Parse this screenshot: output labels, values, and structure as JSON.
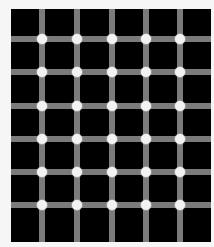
{
  "figure": {
    "canvas": {
      "width": 214,
      "height": 247,
      "background": "#f6f6f6"
    },
    "board": {
      "left": 11,
      "top": 9,
      "right": 211,
      "bottom": 242,
      "color": "#000000"
    },
    "lines": {
      "color": "#7b7b7b",
      "width": 6,
      "vertical_x": [
        42,
        77,
        112,
        146,
        180
      ],
      "horizontal_y": [
        39,
        72,
        106,
        139,
        172,
        205
      ]
    },
    "dots": {
      "color": "#f2f2f2",
      "diameter": 10,
      "columns": 5,
      "rows": 6
    }
  }
}
